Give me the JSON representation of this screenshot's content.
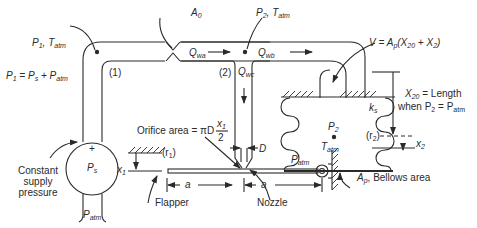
{
  "diagram": {
    "labels": {
      "p1_tatm": {
        "main": "P",
        "sub": "1",
        "rest": ", T",
        "sub2": "atm"
      },
      "p1_eq": {
        "a": "P",
        "a_sub": "1",
        "b": " = P",
        "b_sub": "s",
        "c": " + P",
        "c_sub": "atm"
      },
      "node1": "(1)",
      "node2": "(2)",
      "a0": {
        "main": "A",
        "sub": "0"
      },
      "p2_tatm": {
        "main": "P",
        "sub": "2",
        "rest": ", T",
        "sub2": "atm"
      },
      "qwa": {
        "main": "Q",
        "sub": "wa"
      },
      "qwb": {
        "main": "Q",
        "sub": "wb"
      },
      "qwc": {
        "main": "Q",
        "sub": "wc"
      },
      "volume": {
        "a": "V = A",
        "a_sub": "p",
        "b": "(X",
        "b_sub": "20",
        "c": " + X",
        "c_sub": "2",
        "d": ")"
      },
      "ps": {
        "main": "P",
        "sub": "s"
      },
      "plus": "+",
      "supply": [
        "Constant",
        "supply",
        "pressure"
      ],
      "patm_bottom": {
        "main": "P",
        "sub": "atm"
      },
      "orifice": {
        "text": "Orifice area = πD",
        "frac_num": "x",
        "frac_num_sub": "1",
        "frac_den": "2"
      },
      "d": "D",
      "x1": {
        "main": "x",
        "sub": "1"
      },
      "r1": "(r",
      "r1_sub": "1",
      "r1_end": ")",
      "a_left": "a",
      "a_right": "a",
      "flapper": "Flapper",
      "nozzle": "Nozzle",
      "patm_flapper": {
        "main": "P",
        "sub": "atm"
      },
      "bellows_p2": {
        "main": "P",
        "sub": "2"
      },
      "bellows_tatm": {
        "main": "T",
        "sub": "atm"
      },
      "ks": {
        "main": "k",
        "sub": "s"
      },
      "x20": {
        "a": "X",
        "a_sub": "20",
        "b": " = Length"
      },
      "when": {
        "a": "when P",
        "a_sub": "2",
        "b": " = P",
        "b_sub": "atm"
      },
      "r2": "(r",
      "r2_sub": "2",
      "r2_end": ")",
      "x2": {
        "main": "x",
        "sub": "2"
      },
      "bellows_area": {
        "main": "A",
        "sub": "p",
        "rest": ", Bellows area"
      }
    }
  }
}
